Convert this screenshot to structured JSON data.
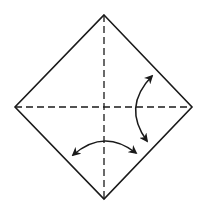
{
  "diagram": {
    "type": "origami-fold-diagram",
    "description": "Square paper shown as a diamond with two dashed valley-fold crease lines (vertical and horizontal diagonals) and two curved double-headed arrows indicating fold and unfold.",
    "colors": {
      "background": "#ffffff",
      "stroke": "#1a1a1a"
    },
    "paper": {
      "shape": "diamond",
      "vertices": {
        "top": [
          104,
          15
        ],
        "right": [
          192,
          107
        ],
        "bottom": [
          104,
          199
        ],
        "left": [
          15,
          107
        ]
      }
    },
    "creases": [
      {
        "name": "vertical-crease",
        "style": "dashed",
        "from": [
          104,
          15
        ],
        "to": [
          104,
          199
        ]
      },
      {
        "name": "horizontal-crease",
        "style": "dashed",
        "from": [
          15,
          107
        ],
        "to": [
          192,
          107
        ]
      }
    ],
    "arrows": [
      {
        "name": "right-fold-arrow",
        "heads": "both",
        "from": [
          153,
          74
        ],
        "via": [
          137,
          107
        ],
        "to": [
          148,
          143
        ]
      },
      {
        "name": "bottom-fold-arrow",
        "heads": "both",
        "from": [
          71,
          156
        ],
        "via": [
          104,
          141
        ],
        "to": [
          138,
          154
        ]
      }
    ]
  }
}
